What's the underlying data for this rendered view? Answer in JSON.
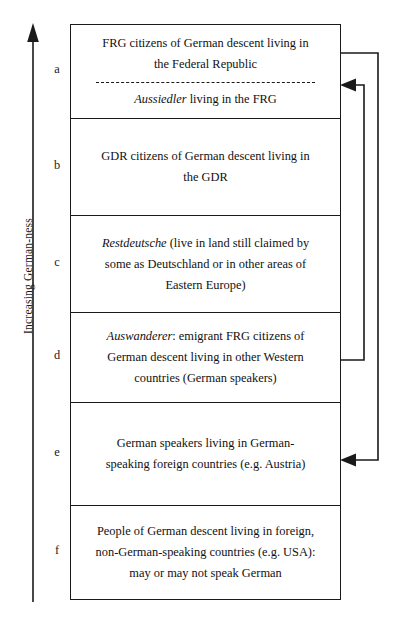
{
  "figure": {
    "axis_label": "Increasing German-ness",
    "axis_direction": "up"
  },
  "rows": [
    {
      "letter": "a",
      "height": 94,
      "split": true,
      "top_lines": [
        "FRG citizens of German descent living in",
        "the Federal Republic"
      ],
      "bottom_lines": [
        "<i>Aussiedler</i> living in the FRG"
      ]
    },
    {
      "letter": "b",
      "height": 97,
      "split": false,
      "lines": [
        "GDR citizens of German descent living in",
        "the GDR"
      ]
    },
    {
      "letter": "c",
      "height": 97,
      "split": false,
      "lines": [
        "<i>Restdeutsche</i> (live in land still claimed by",
        "some as Deutschland or in other areas of",
        "Eastern Europe)"
      ]
    },
    {
      "letter": "d",
      "height": 90,
      "split": false,
      "lines": [
        "<i>Auswanderer</i>: emigrant FRG citizens of",
        "German descent living in other Western",
        "countries (German speakers)"
      ]
    },
    {
      "letter": "e",
      "height": 103,
      "split": false,
      "lines": [
        "German speakers living in German-",
        "speaking foreign countries (e.g. Austria)"
      ]
    },
    {
      "letter": "f",
      "height": 93,
      "split": false,
      "lines": [
        "People of German descent living in foreign,",
        "non-German-speaking countries (e.g. USA):",
        "may or may not speak German"
      ]
    }
  ],
  "connectors": [
    {
      "name": "outer-bracket",
      "from_row": "a",
      "to_row": "e",
      "arrow_into": "e",
      "note": "bracket spanning from top of row a down to row e"
    },
    {
      "name": "inner-bracket",
      "from_row": "a",
      "to_row": "d",
      "arrow_into": "a",
      "note": "bracket from row d up into the Aussiedler half of row a"
    }
  ],
  "colors": {
    "stroke": "#1a1a1a",
    "text": "#111111",
    "background": "#ffffff"
  }
}
